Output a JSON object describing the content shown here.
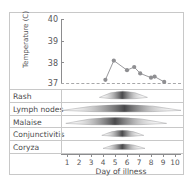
{
  "chart_data": {
    "type": "line",
    "title": "",
    "ylabel": "Temperature (C)",
    "xlabel": "Day of illness",
    "ylim": [
      37,
      40
    ],
    "xlim": [
      0.5,
      10.5
    ],
    "yticks": [
      40,
      39,
      38,
      37
    ],
    "xticks": [
      1,
      2,
      3,
      4,
      5,
      6,
      7,
      8,
      9,
      10
    ],
    "grid": false,
    "legend": null,
    "baseline_value": 37,
    "baseline_style": "dashed",
    "series": [
      {
        "name": "Temperature",
        "marker": "circle",
        "color": "#8f8f92",
        "x": [
          4.2,
          4.9,
          6.0,
          6.6,
          7.1,
          8.0,
          8.3,
          9.1
        ],
        "values": [
          37.15,
          38.05,
          37.6,
          37.75,
          37.45,
          37.25,
          37.3,
          37.05
        ]
      }
    ],
    "symptom_rows": [
      {
        "label": "Rash",
        "start": 3.7,
        "end": 7.7,
        "peak": 5.6,
        "intensity": 1.0
      },
      {
        "label": "Lymph nodes",
        "start": 0.6,
        "end": 10.5,
        "peak": 5.8,
        "intensity": 0.9
      },
      {
        "label": "Malaise",
        "start": 0.9,
        "end": 9.3,
        "peak": 5.0,
        "intensity": 0.95
      },
      {
        "label": "Conjunctivitis",
        "start": 3.9,
        "end": 7.4,
        "peak": 5.6,
        "intensity": 0.75
      },
      {
        "label": "Coryza",
        "start": 4.0,
        "end": 7.5,
        "peak": 5.6,
        "intensity": 0.6
      }
    ]
  },
  "colors": {
    "frame": "#c8c8c8",
    "axis": "#8c8c8e",
    "text": "#4a4a4c",
    "tick_text": "#58585a",
    "band": "#6e6e70",
    "marker": "#8f8f92"
  }
}
